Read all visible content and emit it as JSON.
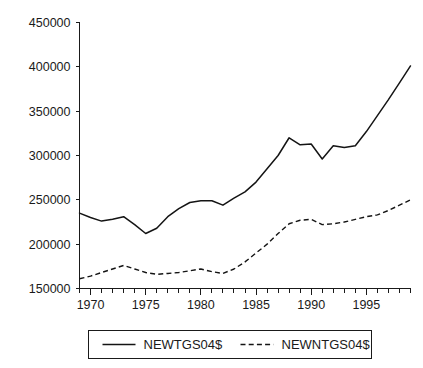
{
  "chart_data": {
    "type": "line",
    "title": "",
    "subtitle": "",
    "xlabel": "",
    "ylabel": "",
    "xlim": [
      1969,
      1999
    ],
    "ylim": [
      150000,
      450000
    ],
    "grid": false,
    "legend_position": "bottom",
    "y_ticks": [
      150000,
      200000,
      250000,
      300000,
      350000,
      400000,
      450000
    ],
    "y_tick_labels": [
      "150000",
      "200000",
      "250000",
      "300000",
      "350000",
      "400000",
      "450000"
    ],
    "x_ticks": [
      1970,
      1975,
      1980,
      1985,
      1990,
      1995
    ],
    "x_tick_labels": [
      "1970",
      "1975",
      "1980",
      "1985",
      "1990",
      "1995"
    ],
    "x_minor_ticks": [
      1969,
      1970,
      1971,
      1972,
      1973,
      1974,
      1975,
      1976,
      1977,
      1978,
      1979,
      1980,
      1981,
      1982,
      1983,
      1984,
      1985,
      1986,
      1987,
      1988,
      1989,
      1990,
      1991,
      1992,
      1993,
      1994,
      1995,
      1996,
      1997,
      1998,
      1999
    ],
    "x": [
      1969,
      1970,
      1971,
      1972,
      1973,
      1974,
      1975,
      1976,
      1977,
      1978,
      1979,
      1980,
      1981,
      1982,
      1983,
      1984,
      1985,
      1986,
      1987,
      1988,
      1989,
      1990,
      1991,
      1992,
      1993,
      1994,
      1995,
      1996,
      1997,
      1998,
      1999
    ],
    "series": [
      {
        "name": "NEWTGS04$",
        "style": "solid",
        "color": "#141414",
        "values": [
          235000,
          230000,
          226000,
          228000,
          231000,
          222000,
          212000,
          218000,
          231000,
          240000,
          247000,
          249000,
          249000,
          244000,
          252000,
          259000,
          270000,
          285000,
          300000,
          320000,
          312000,
          313000,
          296000,
          311000,
          309000,
          311000,
          327000,
          345000,
          363000,
          382000,
          401000
        ]
      },
      {
        "name": "NEWNTGS04$",
        "style": "dashed",
        "color": "#141414",
        "values": [
          161000,
          164000,
          168000,
          172000,
          176000,
          172000,
          168000,
          166000,
          167000,
          168000,
          170000,
          172000,
          169000,
          167000,
          172000,
          180000,
          190000,
          200000,
          212000,
          223000,
          227000,
          228000,
          222000,
          223000,
          225000,
          228000,
          231000,
          233000,
          238000,
          244000,
          250000
        ]
      }
    ]
  },
  "legend": {
    "entries": [
      {
        "label": "NEWTGS04$",
        "style": "solid"
      },
      {
        "label": "NEWNTGS04$",
        "style": "dashed"
      }
    ]
  }
}
